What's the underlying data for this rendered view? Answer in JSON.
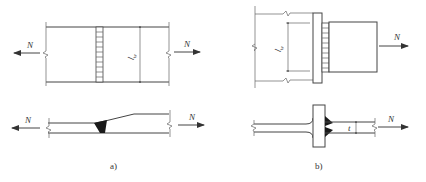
{
  "diagram": {
    "panels": [
      {
        "id": "a",
        "caption": "a)",
        "description": "Butt weld joint between two plates of different thickness",
        "plan_view": {
          "force_left": "N",
          "force_right": "N",
          "weld_length_label": "l_w",
          "weld_length_main": "l",
          "weld_length_sub": "w"
        },
        "section_view": {
          "force_left": "N",
          "force_right": "N",
          "weld_type": "butt weld (filled)"
        }
      },
      {
        "id": "b",
        "caption": "b)",
        "description": "T-joint with fillet welds, plate attached to flange",
        "plan_view": {
          "force_right": "N",
          "weld_length_label": "l_w",
          "weld_length_main": "l",
          "weld_length_sub": "w"
        },
        "section_view": {
          "force_right": "N",
          "thickness_label": "t",
          "weld_type": "double fillet weld"
        }
      }
    ],
    "colors": {
      "line": "#444444",
      "weld_fill": "#1a1a1a",
      "background": "#ffffff"
    }
  }
}
